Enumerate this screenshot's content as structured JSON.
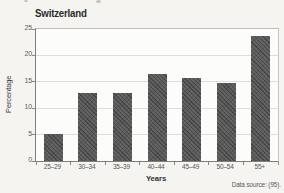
{
  "header": {
    "title": "Switzerland"
  },
  "chart_data": {
    "type": "bar",
    "title": "Switzerland",
    "categories": [
      "25–29",
      "30–34",
      "35–39",
      "40–44",
      "45–49",
      "50–54",
      "55+"
    ],
    "values": [
      5.2,
      12.8,
      12.8,
      16.4,
      15.8,
      14.8,
      23.7
    ],
    "xlabel": "Years",
    "ylabel": "Percentage",
    "ylim": [
      0,
      25
    ],
    "yticks": [
      0,
      5,
      10,
      15,
      20,
      25
    ],
    "grid": true,
    "legend_position": "none",
    "bar_color": "#5e5e5e",
    "gridline_color": "#dddcd7",
    "axis_color": "#7e7e7e"
  },
  "footer": {
    "data_source": "Data source: (95)."
  }
}
